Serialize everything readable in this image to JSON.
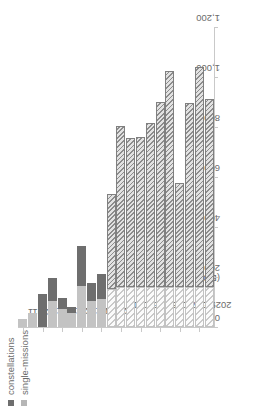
{
  "legend": {
    "position": "top-left",
    "items": [
      {
        "label": "constellations",
        "color": "#6e6e6e",
        "marker": "square-marker"
      },
      {
        "label": "single-missions",
        "color": "#b6b6b6",
        "marker": "square-marker"
      }
    ]
  },
  "axes": {
    "value_axis_title": "(EO)",
    "value_ticks": [
      "0",
      "200",
      "400",
      "600",
      "800",
      "1,000",
      "1,200"
    ],
    "category_ticks": [
      "2011",
      "2013",
      "2015",
      "2017",
      "2019",
      "2021E",
      "2023E",
      "2025E",
      "2027E",
      "2029E"
    ]
  },
  "chart_data": {
    "type": "bar",
    "orientation": "horizontal-rotated",
    "title": "",
    "xlabel": "",
    "ylabel": "(EO)",
    "ylim": [
      0,
      1200
    ],
    "grid": false,
    "legend_position": "top-left",
    "categories": [
      "2011",
      "2012",
      "2013",
      "2014",
      "2015",
      "2016",
      "2017",
      "2018",
      "2019",
      "2020E",
      "2021E",
      "2022E",
      "2023E",
      "2024E",
      "2025E",
      "2026E",
      "2027E",
      "2028E",
      "2029E",
      "2030E"
    ],
    "series": [
      {
        "name": "single-missions",
        "color": "#c3c3c3",
        "values": [
          30,
          55,
          0,
          105,
          70,
          55,
          165,
          105,
          110,
          150,
          160,
          160,
          160,
          160,
          160,
          160,
          160,
          160,
          160,
          160
        ]
      },
      {
        "name": "constellations",
        "color": "#6e6e6e",
        "values": [
          0,
          0,
          130,
          90,
          45,
          25,
          160,
          70,
          100,
          380,
          645,
          595,
          600,
          655,
          740,
          865,
          415,
          735,
          880,
          750
        ]
      }
    ],
    "totals": [
      30,
      55,
      130,
      195,
      115,
      80,
      325,
      175,
      210,
      530,
      805,
      755,
      760,
      815,
      900,
      1025,
      575,
      895,
      1040,
      910
    ],
    "forecast_from_category": "2020E"
  }
}
